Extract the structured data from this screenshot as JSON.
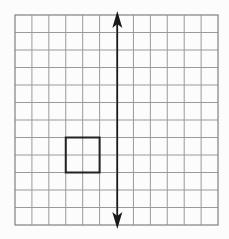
{
  "diagram": {
    "type": "grid-reflection",
    "grid": {
      "columns": 12,
      "rows": 12,
      "origin_px": [
        15,
        15
      ],
      "cell_width_px": 16.92,
      "cell_height_px": 17.5,
      "line_color": "#9a9a9a",
      "border_color": "#8a8a8a"
    },
    "line_of_reflection": {
      "kind": "double-headed-arrow",
      "orientation": "vertical",
      "grid_x": 6,
      "from_grid_y": 0,
      "to_grid_y": 12,
      "color": "#1a1a1a"
    },
    "shape": {
      "kind": "square",
      "grid_x": 3,
      "grid_y": 7,
      "size_cells": 2,
      "stroke_color": "#222222"
    }
  }
}
